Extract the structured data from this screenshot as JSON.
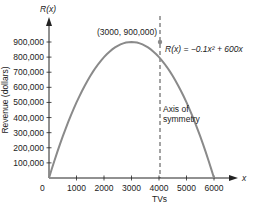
{
  "chart_data": {
    "type": "line",
    "title": "",
    "function_label": "R(x) = −0.1x² + 600x",
    "xlabel": "TVs",
    "ylabel": "Revenue (dollars)",
    "x_axis_var": "x",
    "y_axis_var": "R(x)",
    "xlim": [
      0,
      6000
    ],
    "ylim": [
      0,
      900000
    ],
    "x_ticks": [
      0,
      1000,
      2000,
      3000,
      4000,
      5000,
      6000
    ],
    "x_tick_labels": [
      "0",
      "1000",
      "2000",
      "3000",
      "4000",
      "5000",
      "6000"
    ],
    "y_ticks": [
      100000,
      200000,
      300000,
      400000,
      500000,
      600000,
      700000,
      800000,
      900000
    ],
    "y_tick_labels": [
      "100,000",
      "200,000",
      "300,000",
      "400,000",
      "500,000",
      "600,000",
      "700,000",
      "800,000",
      "900,000"
    ],
    "series": [
      {
        "name": "R(x) = −0.1x² + 600x",
        "x": [
          0,
          500,
          1000,
          1500,
          2000,
          2500,
          3000,
          3500,
          4000,
          4500,
          5000,
          5500,
          6000
        ],
        "values": [
          0,
          275000,
          500000,
          675000,
          800000,
          875000,
          900000,
          875000,
          800000,
          675000,
          500000,
          275000,
          0
        ]
      }
    ],
    "annotations": [
      {
        "text": "(3000, 900,000)",
        "x": 3000,
        "y": 900000,
        "type": "vertex-point"
      },
      {
        "text": "Axis of symmetry",
        "x": 3000,
        "type": "dashed-vertical-line"
      }
    ],
    "grid": false,
    "legend": "none"
  },
  "labels": {
    "y_var": "R(x)",
    "x_var": "x",
    "vertex": "(3000, 900,000)",
    "equation": "R(x) = −0.1x² + 600x",
    "axis_sym_1": "Axis of",
    "axis_sym_2": "symmetry",
    "xlabel": "TVs",
    "ylabel": "Revenue (dollars)",
    "origin": "0"
  }
}
